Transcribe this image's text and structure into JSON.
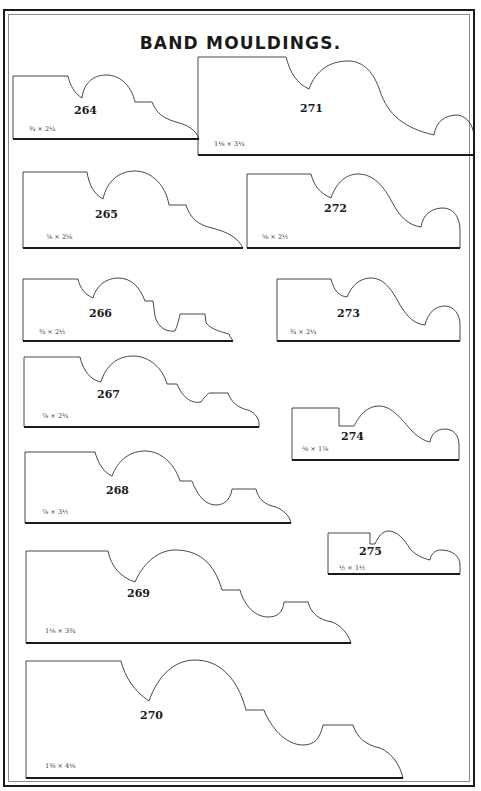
{
  "page": {
    "title": "BAND MOULDINGS."
  },
  "mouldings": [
    {
      "number": "264",
      "size": "¾ × 2¼"
    },
    {
      "number": "271",
      "size": "1⅛ × 3¼"
    },
    {
      "number": "265",
      "size": "⅞ × 2⅝"
    },
    {
      "number": "272",
      "size": "⅝ × 2½"
    },
    {
      "number": "266",
      "size": "¾ × 2½"
    },
    {
      "number": "273",
      "size": "¾ × 2¼"
    },
    {
      "number": "267",
      "size": "⅞ × 2¾"
    },
    {
      "number": "274",
      "size": "⅝ × 1⅞"
    },
    {
      "number": "268",
      "size": "⅞ × 3½"
    },
    {
      "number": "275",
      "size": "½ × 1½"
    },
    {
      "number": "269",
      "size": "1⅛ × 3¾"
    },
    {
      "number": "270",
      "size": "1⅜ × 4⅛"
    }
  ]
}
